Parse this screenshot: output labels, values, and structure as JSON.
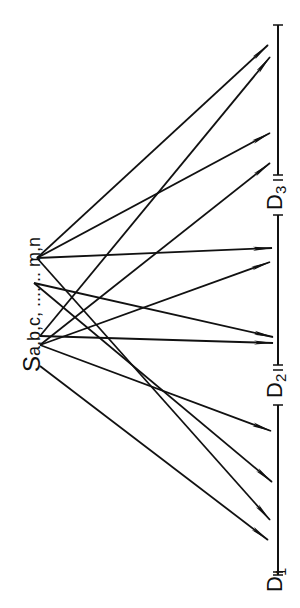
{
  "source": {
    "label_main": "S",
    "label_sub": "a,b,c, ....... m,n",
    "points": {
      "n": [
        37,
        258
      ],
      "m": [
        34,
        283
      ],
      "c": [
        40,
        336
      ],
      "b": [
        40,
        345
      ],
      "a": [
        40,
        366
      ]
    }
  },
  "destinations": [
    {
      "label_main": "D",
      "label_sub": "1",
      "y": 575
    },
    {
      "label_main": "D",
      "label_sub": "2",
      "y": 372
    },
    {
      "label_main": "D",
      "label_sub": "3",
      "y": 183
    }
  ],
  "axis": {
    "x": 278,
    "y_top": 25,
    "y_bottom": 575,
    "color": "#111111"
  },
  "arrows": [
    {
      "from": "n",
      "to": [
        268,
        45
      ]
    },
    {
      "from": "c",
      "to": [
        270,
        57
      ]
    },
    {
      "from": "n",
      "to": [
        270,
        133
      ]
    },
    {
      "from": "b",
      "to": [
        270,
        163
      ]
    },
    {
      "from": "n",
      "to": [
        272,
        248
      ]
    },
    {
      "from": "b",
      "to": [
        270,
        262
      ]
    },
    {
      "from": "m",
      "to": [
        273,
        337
      ]
    },
    {
      "from": "c",
      "to": [
        273,
        343
      ]
    },
    {
      "from": "b",
      "to": [
        271,
        431
      ]
    },
    {
      "from": "m",
      "to": [
        272,
        482
      ]
    },
    {
      "from": "n",
      "to": [
        270,
        520
      ]
    },
    {
      "from": "a",
      "to": [
        268,
        540
      ]
    }
  ],
  "colors": {
    "line": "#111111",
    "background": "#ffffff"
  }
}
